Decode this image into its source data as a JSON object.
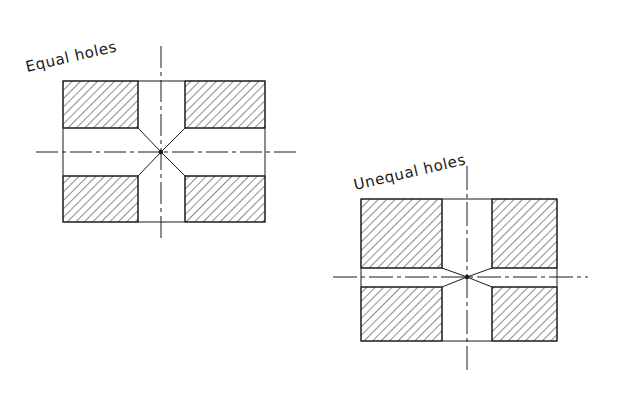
{
  "figure": {
    "style": {
      "line_color": "#1a1a1a",
      "hatch_color": "#1a1a1a",
      "background_color": "#ffffff",
      "line_width": 1,
      "hatch_angle_deg": 45,
      "hatch_spacing_px": 6,
      "centerline_pattern": "dash-dot"
    },
    "views": [
      {
        "id": "equal-holes",
        "label": "Equal holes",
        "label_rotation_deg": -13,
        "label_x": 27,
        "label_y": 72,
        "body": {
          "x": 63,
          "y": 81,
          "width": 202,
          "height": 141
        },
        "vertical_hole": {
          "x_left": 138,
          "x_right": 185,
          "width": 47
        },
        "horizontal_hole": {
          "y_top": 128,
          "y_bottom": 176,
          "height": 48
        },
        "center": {
          "x": 161,
          "y": 152
        },
        "intersection_angle_deg": 45,
        "centerline_vertical": {
          "x": 161,
          "y_top": 46,
          "y_bottom": 238
        },
        "centerline_horizontal": {
          "y": 152,
          "x_left": 36,
          "x_right": 296
        },
        "hatched_blocks": [
          {
            "name": "top-left",
            "x": 63,
            "y": 81,
            "width": 75,
            "height": 47
          },
          {
            "name": "top-right",
            "x": 185,
            "y": 81,
            "width": 80,
            "height": 47
          },
          {
            "name": "bottom-left",
            "x": 63,
            "y": 176,
            "width": 75,
            "height": 46
          },
          {
            "name": "bottom-right",
            "x": 185,
            "y": 176,
            "width": 80,
            "height": 46
          }
        ]
      },
      {
        "id": "unequal-holes",
        "label": "Unequal holes",
        "label_rotation_deg": -13,
        "label_x": 355,
        "label_y": 190,
        "body": {
          "x": 361,
          "y": 199,
          "width": 196,
          "height": 142
        },
        "vertical_hole": {
          "x_left": 442,
          "x_right": 492,
          "width": 50
        },
        "horizontal_hole": {
          "y_top": 268,
          "y_bottom": 287,
          "height": 19
        },
        "center": {
          "x": 467,
          "y": 277
        },
        "intersection_angle_deg": 21,
        "centerline_vertical": {
          "x": 467,
          "y_top": 166,
          "y_bottom": 372
        },
        "centerline_horizontal": {
          "y": 277,
          "x_left": 333,
          "x_right": 588
        },
        "hatched_blocks": [
          {
            "name": "top-left",
            "x": 361,
            "y": 199,
            "width": 81,
            "height": 69
          },
          {
            "name": "top-right",
            "x": 492,
            "y": 199,
            "width": 65,
            "height": 69
          },
          {
            "name": "bottom-left",
            "x": 361,
            "y": 287,
            "width": 81,
            "height": 54
          },
          {
            "name": "bottom-right",
            "x": 492,
            "y": 287,
            "width": 65,
            "height": 54
          }
        ]
      }
    ]
  }
}
